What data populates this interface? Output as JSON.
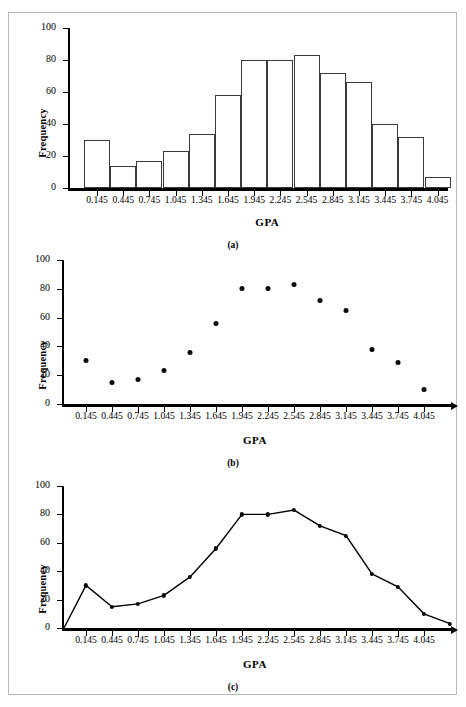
{
  "chart_data": [
    {
      "type": "bar",
      "panel": "a",
      "caption": "(a)",
      "title": "",
      "xlabel": "GPA",
      "ylabel": "Frequency",
      "categories": [
        "0.145",
        "0.445",
        "0.745",
        "1.045",
        "1.345",
        "1.645",
        "1.945",
        "2.245",
        "2.545",
        "2.845",
        "3.145",
        "3.445",
        "3.745",
        "4.045"
      ],
      "values": [
        30,
        14,
        17,
        23,
        34,
        58,
        80,
        80,
        83,
        72,
        66,
        40,
        32,
        7
      ],
      "ylim": [
        0,
        100
      ],
      "yticks": [
        0,
        20,
        40,
        60,
        80,
        100
      ],
      "grid": false,
      "legend": false
    },
    {
      "type": "scatter",
      "panel": "b",
      "caption": "(b)",
      "title": "",
      "xlabel": "GPA",
      "ylabel": "Frequency",
      "categories": [
        "0.145",
        "0.445",
        "0.745",
        "1.045",
        "1.345",
        "1.645",
        "1.945",
        "2.245",
        "2.545",
        "2.845",
        "3.145",
        "3.445",
        "3.745",
        "4.045"
      ],
      "values": [
        30,
        15,
        17,
        23,
        36,
        56,
        80,
        80,
        83,
        72,
        65,
        38,
        29,
        10
      ],
      "ylim": [
        0,
        100
      ],
      "yticks": [
        0,
        20,
        40,
        60,
        80,
        100
      ],
      "grid": false,
      "legend": false
    },
    {
      "type": "line",
      "panel": "c",
      "caption": "(c)",
      "title": "",
      "xlabel": "GPA",
      "ylabel": "Frequency",
      "categories": [
        "0.145",
        "0.445",
        "0.745",
        "1.045",
        "1.345",
        "1.645",
        "1.945",
        "2.245",
        "2.545",
        "2.845",
        "3.145",
        "3.445",
        "3.745",
        "4.045"
      ],
      "values": [
        30,
        15,
        17,
        23,
        36,
        56,
        80,
        80,
        83,
        72,
        65,
        38,
        29,
        10
      ],
      "anchor_start": 0,
      "anchor_end": 3,
      "markers": true,
      "ylim": [
        0,
        100
      ],
      "yticks": [
        0,
        20,
        40,
        60,
        80,
        100
      ],
      "grid": false,
      "legend": false
    }
  ],
  "panels": {
    "a": {
      "caption": "(a)",
      "xlabel": "GPA",
      "ylabel": "Frequency"
    },
    "b": {
      "caption": "(b)",
      "xlabel": "GPA",
      "ylabel": "Frequency"
    },
    "c": {
      "caption": "(c)",
      "xlabel": "GPA",
      "ylabel": "Frequency"
    }
  }
}
